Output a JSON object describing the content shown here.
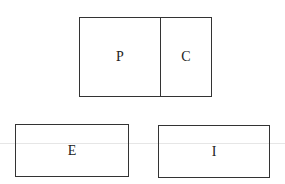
{
  "diagram": {
    "top_group": {
      "left_label": "P",
      "right_label": "C"
    },
    "bottom_left": {
      "label": "E"
    },
    "bottom_right": {
      "label": "I"
    },
    "stroke_color": "#333333"
  }
}
